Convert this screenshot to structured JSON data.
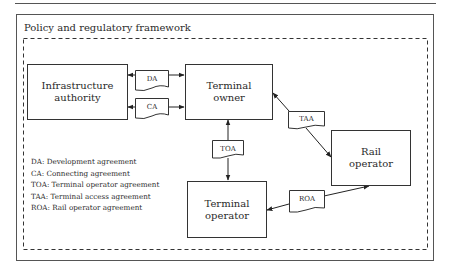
{
  "frame": {
    "title": "Policy and regulatory framework"
  },
  "entities": {
    "infrastructure_authority": "Infrastructure\nauthority",
    "terminal_owner": "Terminal\nowner",
    "rail_operator": "Rail\noperator",
    "terminal_operator": "Terminal\noperator"
  },
  "agreements": {
    "da": "DA",
    "ca": "CA",
    "taa": "TAA",
    "toa": "TOA",
    "roa": "ROA"
  },
  "legend": [
    "DA: Development agreement",
    "CA: Connecting agreement",
    "TOA: Terminal operator agreement",
    "TAA: Terminal access agreement",
    "ROA: Rail operator agreement"
  ],
  "connections": [
    {
      "from": "Infrastructure authority",
      "to": "Terminal owner",
      "via": "DA",
      "direction": "bidirectional"
    },
    {
      "from": "Infrastructure authority",
      "to": "Terminal owner",
      "via": "CA",
      "direction": "bidirectional"
    },
    {
      "from": "Terminal owner",
      "to": "Rail operator",
      "via": "TAA",
      "direction": "bidirectional"
    },
    {
      "from": "Terminal owner",
      "to": "Terminal operator",
      "via": "TOA",
      "direction": "bidirectional"
    },
    {
      "from": "Terminal operator",
      "to": "Rail operator",
      "via": "ROA",
      "direction": "bidirectional"
    }
  ]
}
